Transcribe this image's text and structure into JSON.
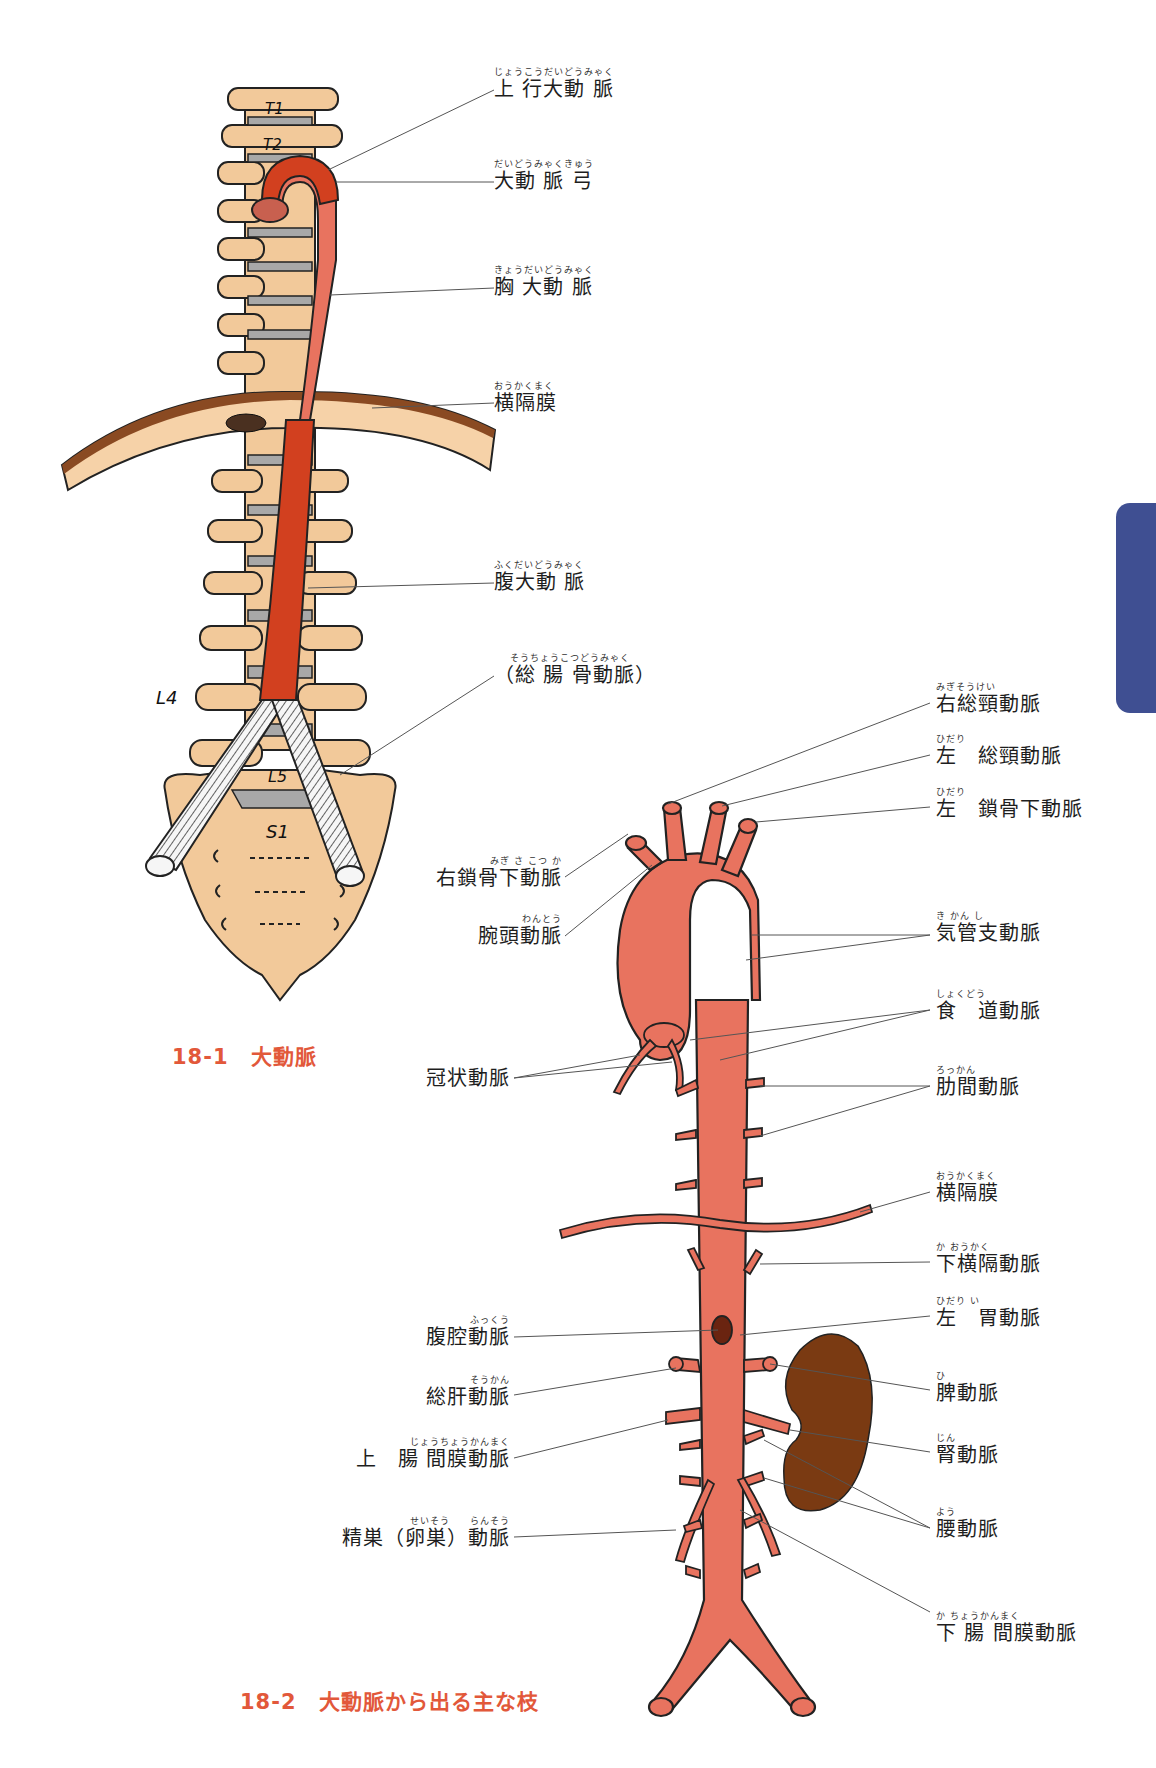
{
  "figure1": {
    "caption": "18-1　大動脈",
    "vertebra_labels": [
      "T1",
      "T2",
      "L4",
      "L5",
      "S1"
    ],
    "labels": [
      {
        "id": "ascending-aorta",
        "ruby": "じょうこうだいどうみゃく",
        "text": "上 行大動 脈"
      },
      {
        "id": "aortic-arch",
        "ruby": "だいどうみゃくきゅう",
        "text": "大動 脈 弓"
      },
      {
        "id": "thoracic-aorta",
        "ruby": "きょうだいどうみゃく",
        "text": "胸 大動 脈"
      },
      {
        "id": "diaphragm",
        "ruby": "おうかくまく",
        "text": "横隔膜"
      },
      {
        "id": "abdominal-aorta",
        "ruby": "ふくだいどうみゃく",
        "text": "腹大動 脈"
      },
      {
        "id": "common-iliac-artery",
        "ruby": "そうちょうこつどうみゃく",
        "text": "（総 腸 骨動脈）"
      }
    ]
  },
  "figure2": {
    "caption": "18-2　大動脈から出る主な枝",
    "labels_right": [
      {
        "id": "right-common-carotid",
        "ruby": "みぎそうけい",
        "text": "右総頸動脈"
      },
      {
        "id": "left-common-carotid",
        "ruby": "ひだり",
        "text": "左　総頸動脈"
      },
      {
        "id": "left-subclavian",
        "ruby": "ひだり",
        "text": "左　鎖骨下動脈"
      },
      {
        "id": "bronchial-arteries",
        "ruby": "き かん し",
        "text": "気管支動脈"
      },
      {
        "id": "esophageal-arteries",
        "ruby": "しょくどう",
        "text": "食　道動脈"
      },
      {
        "id": "intercostal-arteries",
        "ruby": "ろっかん",
        "text": "肋間動脈"
      },
      {
        "id": "diaphragm-2",
        "ruby": "おうかくまく",
        "text": "横隔膜"
      },
      {
        "id": "inferior-phrenic",
        "ruby": "か おうかく",
        "text": "下横隔動脈"
      },
      {
        "id": "left-gastric",
        "ruby": "ひだり い",
        "text": "左　胃動脈"
      },
      {
        "id": "splenic",
        "ruby": "ひ",
        "text": "脾動脈"
      },
      {
        "id": "renal",
        "ruby": "じん",
        "text": "腎動脈"
      },
      {
        "id": "lumbar",
        "ruby": "よう",
        "text": "腰動脈"
      },
      {
        "id": "inferior-mesenteric",
        "ruby": "か ちょうかんまく",
        "text": "下 腸 間膜動脈"
      }
    ],
    "labels_left": [
      {
        "id": "right-subclavian",
        "ruby": "みぎ さ こつ か",
        "text": "右鎖骨下動脈"
      },
      {
        "id": "brachiocephalic",
        "ruby": "わんとう",
        "text": "腕頭動脈"
      },
      {
        "id": "coronary",
        "ruby": "",
        "text": "冠状動脈"
      },
      {
        "id": "celiac",
        "ruby": "ふっくう",
        "text": "腹腔動脈"
      },
      {
        "id": "common-hepatic",
        "ruby": "そうかん",
        "text": "総肝動脈"
      },
      {
        "id": "superior-mesenteric",
        "ruby": "じょうちょうかんまく",
        "text": "上　腸 間膜動脈"
      },
      {
        "id": "gonadal",
        "ruby": "せいそう　　らんそう",
        "text": "精巣（卵巣）動脈"
      }
    ]
  },
  "colors": {
    "caption": "#e2583a",
    "aorta_dark": "#d2401f",
    "aorta_light": "#e8735f",
    "bone": "#f2c99a",
    "disc": "#a8a8a8",
    "diaphragm": "#8a4a22",
    "kidney": "#7a3a12",
    "side_tab": "#3f4f92"
  }
}
